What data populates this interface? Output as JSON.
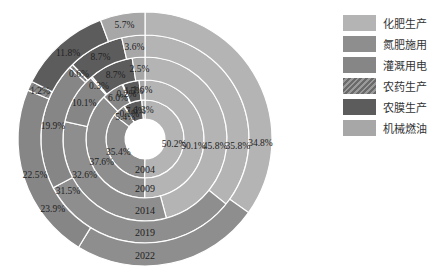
{
  "chart_data": {
    "type": "pie",
    "subtype": "multi-ring donut (sunburst by year)",
    "title": "",
    "categories": [
      "化肥生产",
      "氮肥施用",
      "灌溉用电",
      "农药生产",
      "农膜生产",
      "机械燃油"
    ],
    "colors": [
      "#b4b4b4",
      "#8e8e8e",
      "#868686",
      "#7a7a7a",
      "#5c5c5c",
      "#a7a7a7"
    ],
    "rings_inner_to_outer": [
      "2004",
      "2009",
      "2014",
      "2019",
      "2022"
    ],
    "series": [
      {
        "name": "2004",
        "values": [
          50.2,
          35.4,
          5.4,
          0.1,
          7.6,
          1.3
        ],
        "labels": [
          "50.2%",
          "35.4%",
          "5.4%",
          "0.1%",
          "7.6%",
          "1.3%"
        ]
      },
      {
        "name": "2009",
        "values": [
          50.1,
          37.6,
          6.0,
          0.2,
          4.5,
          1.6
        ],
        "labels": [
          "50.1%",
          "37.6%",
          "6.0%",
          "0.2%",
          "4.5%",
          "1.6%"
        ]
      },
      {
        "name": "2014",
        "values": [
          45.8,
          32.6,
          10.1,
          0.3,
          8.7,
          2.5
        ],
        "labels": [
          "45.8%",
          "32.6%",
          "10.1%",
          "0.3%",
          "8.7%",
          "2.5%"
        ]
      },
      {
        "name": "2019",
        "values": [
          35.8,
          31.5,
          19.9,
          0.6,
          8.7,
          3.6
        ],
        "labels": [
          "35.8%",
          "31.5%",
          "19.9%",
          "0.6%",
          "8.7%",
          "3.6%"
        ]
      },
      {
        "name": "2022",
        "values": [
          34.8,
          23.9,
          22.5,
          1.2,
          11.8,
          5.7
        ],
        "labels": [
          "34.8%",
          "23.9%",
          "22.5%",
          "1.2%",
          "11.8%",
          "5.7%"
        ]
      }
    ],
    "start_angle": "12 o'clock, clockwise",
    "legend_position": "right",
    "unit": "%"
  },
  "legend": {
    "items": [
      {
        "label": "化肥生产",
        "color": "#b4b4b4"
      },
      {
        "label": "氮肥施用",
        "color": "#8e8e8e"
      },
      {
        "label": "灌溉用电",
        "color": "#868686"
      },
      {
        "label": "农药生产",
        "color": "#7a7a7a",
        "pattern": "hatched"
      },
      {
        "label": "农膜生产",
        "color": "#5c5c5c"
      },
      {
        "label": "机械燃油",
        "color": "#a7a7a7"
      }
    ]
  }
}
